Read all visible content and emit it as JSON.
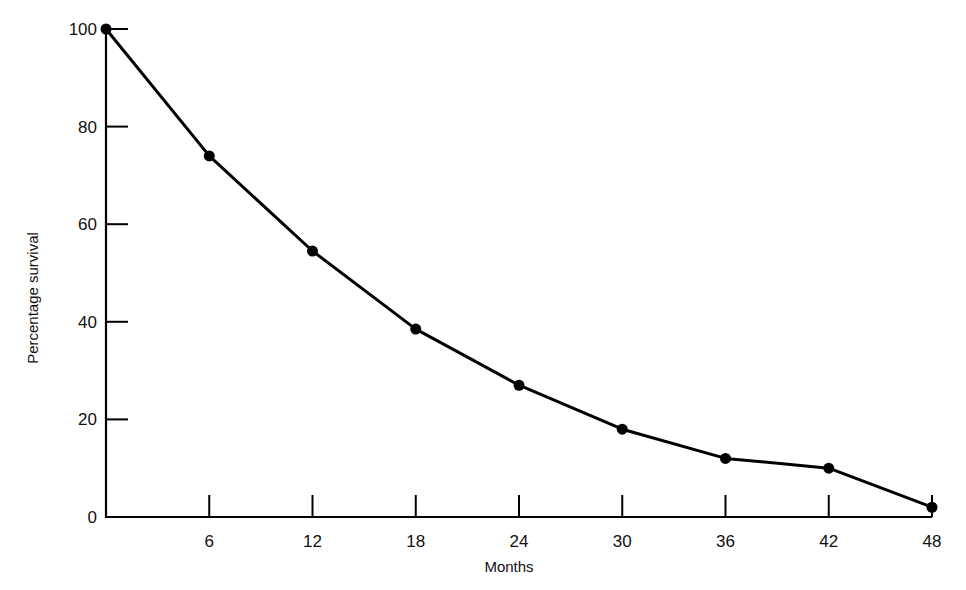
{
  "chart_data": {
    "type": "line",
    "title": "",
    "xlabel": "Months",
    "ylabel": "Percentage survival",
    "x": [
      0,
      6,
      12,
      18,
      24,
      30,
      36,
      42,
      48
    ],
    "series": [
      {
        "name": "Percentage survival",
        "values": [
          100,
          74,
          54.5,
          38.5,
          27,
          18,
          12,
          10,
          2
        ]
      }
    ],
    "x_ticks": [
      6,
      12,
      18,
      24,
      30,
      36,
      42,
      48
    ],
    "x_tick_labels": [
      "6",
      "12",
      "18",
      "24",
      "30",
      "36",
      "42",
      "48"
    ],
    "y_ticks": [
      0,
      20,
      40,
      60,
      80,
      100
    ],
    "y_tick_labels": [
      "0",
      "20",
      "40",
      "60",
      "80",
      "100"
    ],
    "xlim": [
      0,
      48
    ],
    "ylim": [
      0,
      100
    ],
    "grid": false,
    "legend": null,
    "markers": "filled-circle",
    "line_color": "#000000"
  }
}
